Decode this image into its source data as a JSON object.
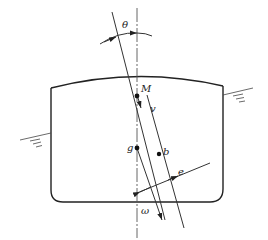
{
  "diagram": {
    "type": "ship-stability-cross-section",
    "labels": {
      "theta": "θ",
      "M": "M",
      "v": "v",
      "g": "g",
      "b": "b",
      "e": "e",
      "omega": "ω"
    },
    "points": {
      "M": {
        "x": 137,
        "y": 96
      },
      "g": {
        "x": 137,
        "y": 148
      },
      "b": {
        "x": 162,
        "y": 153
      }
    },
    "colors": {
      "line": "#333333",
      "background": "#ffffff"
    }
  }
}
